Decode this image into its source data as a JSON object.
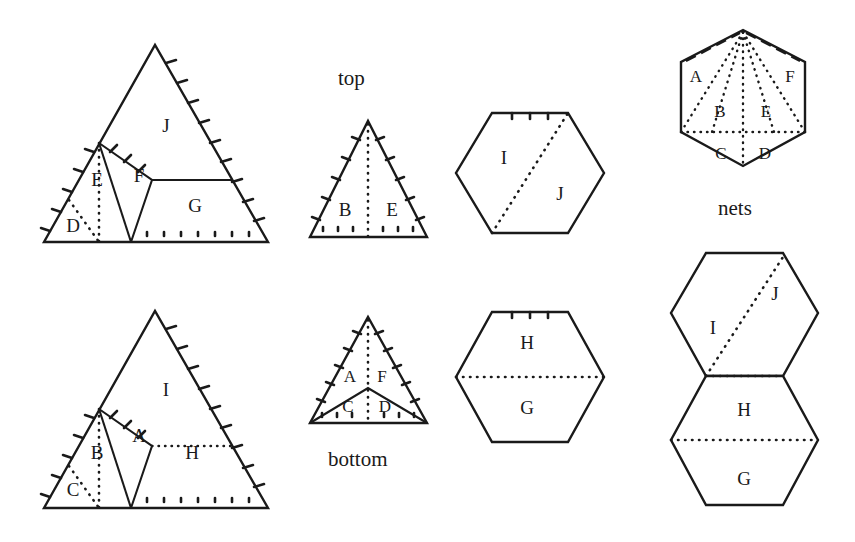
{
  "figure": {
    "title_labels": [
      {
        "name": "top-label",
        "text": "top",
        "x": 338,
        "y": 66
      },
      {
        "name": "bottom-label",
        "text": "bottom",
        "x": 328,
        "y": 447
      },
      {
        "name": "nets-label",
        "text": "nets",
        "x": 718,
        "y": 196
      }
    ],
    "colors": {
      "ink": "#1a1a1a",
      "background": "#ffffff"
    },
    "panels": {
      "triangle_top_left": {
        "name": "top-face-triangle",
        "cell_labels": [
          "D",
          "E",
          "F",
          "G",
          "J"
        ],
        "cells": [
          {
            "label": "D",
            "x": 73,
            "y": 228
          },
          {
            "label": "E",
            "x": 97,
            "y": 182
          },
          {
            "label": "F",
            "x": 139,
            "y": 178
          },
          {
            "label": "G",
            "x": 195,
            "y": 208
          },
          {
            "label": "J",
            "x": 166,
            "y": 128
          }
        ]
      },
      "triangle_bottom_left": {
        "name": "bottom-face-triangle",
        "cell_labels": [
          "C",
          "B",
          "A",
          "H",
          "I"
        ],
        "cells": [
          {
            "label": "C",
            "x": 73,
            "y": 492
          },
          {
            "label": "B",
            "x": 97,
            "y": 455
          },
          {
            "label": "A",
            "x": 139,
            "y": 438
          },
          {
            "label": "H",
            "x": 192,
            "y": 455
          },
          {
            "label": "I",
            "x": 166,
            "y": 392
          }
        ]
      },
      "small_triangle_top": {
        "name": "top-small-triangle",
        "cell_labels": [
          "B",
          "E"
        ],
        "cells": [
          {
            "label": "B",
            "x": 345,
            "y": 212
          },
          {
            "label": "E",
            "x": 392,
            "y": 212
          }
        ]
      },
      "small_triangle_bottom": {
        "name": "bottom-small-triangle",
        "cell_labels": [
          "A",
          "F",
          "C",
          "D"
        ],
        "cells": [
          {
            "label": "A",
            "x": 350,
            "y": 378
          },
          {
            "label": "F",
            "x": 382,
            "y": 378
          },
          {
            "label": "C",
            "x": 348,
            "y": 408
          },
          {
            "label": "D",
            "x": 385,
            "y": 408
          }
        ]
      },
      "hexagon_top": {
        "name": "top-hexagon",
        "cell_labels": [
          "I",
          "J"
        ],
        "cells": [
          {
            "label": "I",
            "x": 504,
            "y": 160
          },
          {
            "label": "J",
            "x": 560,
            "y": 196
          }
        ]
      },
      "hexagon_bottom": {
        "name": "bottom-hexagon",
        "cell_labels": [
          "H",
          "G"
        ],
        "cells": [
          {
            "label": "H",
            "x": 527,
            "y": 345
          },
          {
            "label": "G",
            "x": 527,
            "y": 410
          }
        ]
      },
      "net_hexagon": {
        "name": "net-hexagon-top",
        "cell_labels": [
          "A",
          "F",
          "B",
          "E",
          "C",
          "D"
        ],
        "cells": [
          {
            "label": "A",
            "x": 696,
            "y": 78
          },
          {
            "label": "F",
            "x": 790,
            "y": 78
          },
          {
            "label": "B",
            "x": 720,
            "y": 113
          },
          {
            "label": "E",
            "x": 766,
            "y": 113
          },
          {
            "label": "C",
            "x": 721,
            "y": 155
          },
          {
            "label": "D",
            "x": 765,
            "y": 155
          }
        ]
      },
      "net_hexagons_bottom": {
        "name": "net-hexagon-pair",
        "cell_labels": [
          "I",
          "J",
          "H",
          "G"
        ],
        "cells": [
          {
            "label": "J",
            "x": 775,
            "y": 296
          },
          {
            "label": "I",
            "x": 713,
            "y": 330
          },
          {
            "label": "H",
            "x": 744,
            "y": 412
          },
          {
            "label": "G",
            "x": 744,
            "y": 481
          }
        ]
      }
    }
  }
}
